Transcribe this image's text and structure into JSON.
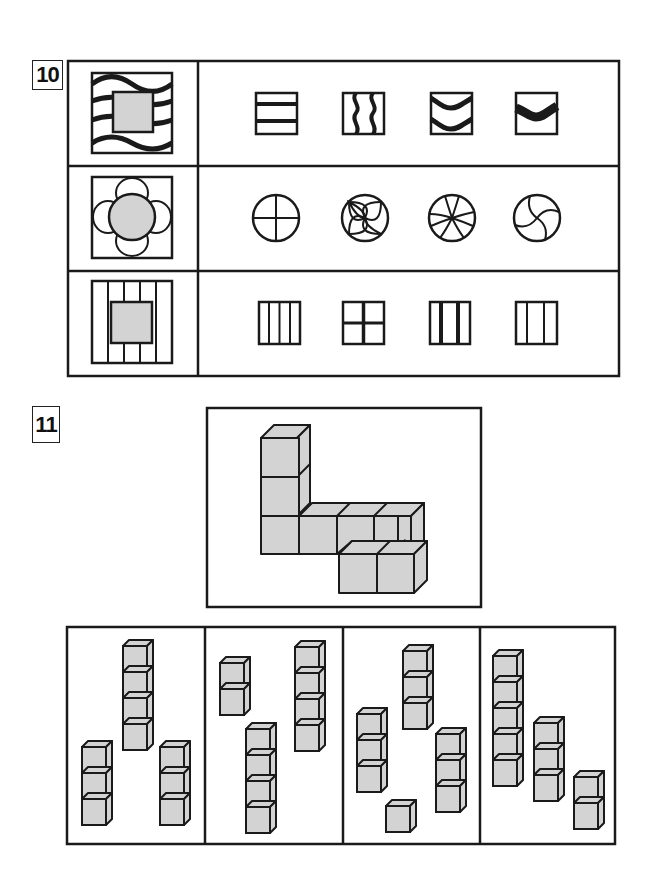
{
  "questions": [
    {
      "number": "10",
      "type": "pattern-matching-table",
      "rows": [
        {
          "prompt": "wavy-lines-square-with-gray-center",
          "options": [
            "two-horizontal-bars",
            "two-vertical-wavy-lines",
            "two-chevron-bands",
            "one-thick-chevron-band"
          ]
        },
        {
          "prompt": "four-petal-flower-with-gray-circle",
          "options": [
            "circle-with-cross",
            "circle-with-four-petals",
            "circle-with-six-curved-spokes",
            "circle-with-swirl"
          ]
        },
        {
          "prompt": "vertical-stripes-square-with-gray-center",
          "options": [
            "four-column-grid",
            "four-quadrant-grid",
            "three-column-thick-dividers",
            "three-column-grid"
          ]
        }
      ]
    },
    {
      "number": "11",
      "type": "cube-assembly",
      "prompt": "L-shaped-cube-structure",
      "options": [
        {
          "columns": [
            4,
            3,
            3
          ]
        },
        {
          "columns": [
            2,
            4,
            4
          ]
        },
        {
          "columns": [
            3,
            3,
            3,
            1
          ]
        },
        {
          "columns": [
            5,
            3,
            2
          ]
        }
      ]
    }
  ],
  "colors": {
    "ink": "#1a1a1a",
    "fill_gray": "#d3d3d3",
    "background": "#ffffff"
  }
}
